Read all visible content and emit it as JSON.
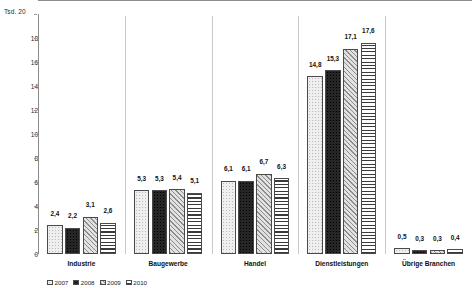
{
  "chart_data": {
    "type": "bar",
    "title": "",
    "xlabel": "",
    "ylabel": "Tsd.",
    "y_unit_label": "Tsd. 20",
    "ylim": [
      0,
      20
    ],
    "yticks": [
      0,
      2,
      4,
      6,
      8,
      10,
      12,
      14,
      16,
      18,
      20
    ],
    "ytick_labels": [
      "0",
      "2",
      "4",
      "6",
      "8",
      "10",
      "12",
      "14",
      "16",
      "18",
      "20"
    ],
    "grid": false,
    "legend_position": "bottom-left",
    "value_decimal_separator": ",",
    "categories": [
      "Industrie",
      "Baugewerbe",
      "Handel",
      "Dienstleistungen",
      "Übrige Branchen"
    ],
    "series": [
      {
        "name": "2007",
        "pattern": "light-dotted",
        "values": [
          2.4,
          5.3,
          6.1,
          14.8,
          0.5
        ],
        "labels": [
          "2,4",
          "5,3",
          "6,1",
          "14,8",
          "0,5"
        ]
      },
      {
        "name": "2008",
        "pattern": "dark-dotted",
        "values": [
          2.2,
          5.3,
          6.1,
          15.3,
          0.3
        ],
        "labels": [
          "2,2",
          "5,3",
          "6,1",
          "15,3",
          "0,3"
        ]
      },
      {
        "name": "2009",
        "pattern": "diagonal-hatch",
        "values": [
          3.1,
          5.4,
          6.7,
          17.1,
          0.3
        ],
        "labels": [
          "3,1",
          "5,4",
          "6,7",
          "17,1",
          "0,3"
        ]
      },
      {
        "name": "2010",
        "pattern": "horizontal-lines",
        "values": [
          2.6,
          5.1,
          6.3,
          17.6,
          0.4
        ],
        "labels": [
          "2,6",
          "5,1",
          "6,3",
          "17,6",
          "0,4"
        ]
      }
    ]
  },
  "colors": {
    "axis": "#8c8c8c",
    "separator": "#c9c9c9",
    "bar_outline": "#4a4a4a",
    "text": "#1a1a1a",
    "background": "#ffffff"
  }
}
